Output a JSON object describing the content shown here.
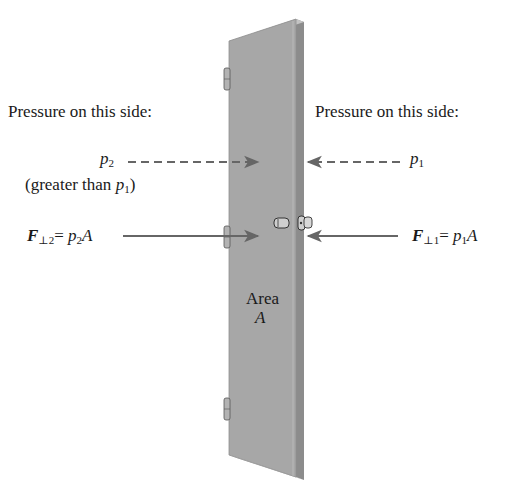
{
  "diagram": {
    "type": "physics-illustration",
    "colors": {
      "door_face": "#a7a7a7",
      "door_edge": "#8c8c8c",
      "door_edge_highlight": "#c4c4c4",
      "arrow": "#666666",
      "text": "#1a1a1a",
      "background": "#ffffff"
    },
    "left": {
      "heading": "Pressure on this side:",
      "pressure_symbol": "p",
      "pressure_subscript": "2",
      "note_prefix": "(greater than ",
      "note_symbol": "p",
      "note_subscript": "1",
      "note_suffix": ")",
      "force_symbol": "F",
      "force_subscript": "⊥2",
      "force_eq": "= ",
      "force_rhs_symbol": "p",
      "force_rhs_subscript": "2",
      "force_rhs_area": "A"
    },
    "right": {
      "heading": "Pressure on this side:",
      "pressure_symbol": "p",
      "pressure_subscript": "1",
      "force_symbol": "F",
      "force_subscript": "⊥1",
      "force_eq": "= ",
      "force_rhs_symbol": "p",
      "force_rhs_subscript": "1",
      "force_rhs_area": "A"
    },
    "door_label": {
      "line1": "Area",
      "line2": "A"
    }
  }
}
